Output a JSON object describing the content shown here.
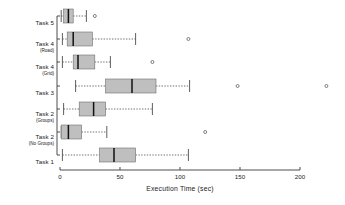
{
  "chart_data": {
    "type": "box",
    "title": "",
    "xlabel": "Execution  Time (sec)",
    "ylabel": "",
    "xlim": [
      -5,
      230
    ],
    "xticks": [
      0,
      50,
      100,
      150,
      200
    ],
    "xticklabels": [
      "0",
      "50",
      "100",
      "150",
      "200"
    ],
    "grid": false,
    "legend": null,
    "orientation": "horizontal",
    "box_fill": "#bfbfbf",
    "box_edge": "#6e6e6e",
    "median_color": "#111111",
    "whisker_style": "dotted",
    "categories": [
      {
        "label": "Task 5",
        "sublabel": ""
      },
      {
        "label": "Task 4",
        "sublabel": "(Road)"
      },
      {
        "label": "Task 4",
        "sublabel": "(Grid)"
      },
      {
        "label": "Task 3",
        "sublabel": ""
      },
      {
        "label": "Task 2",
        "sublabel": "(Groups)"
      },
      {
        "label": "Task 2",
        "sublabel": "(No Groups)"
      },
      {
        "label": "Task 1",
        "sublabel": ""
      }
    ],
    "boxes": [
      {
        "category": "Task 5",
        "min": 1,
        "q1": 3,
        "median": 7,
        "q3": 11,
        "max": 22,
        "outliers": [
          29
        ]
      },
      {
        "category": "Task 4 (Road)",
        "min": 2,
        "q1": 6,
        "median": 11,
        "q3": 27,
        "max": 63,
        "outliers": [
          107
        ]
      },
      {
        "category": "Task 4 (Grid)",
        "min": 2,
        "q1": 11,
        "median": 15,
        "q3": 29,
        "max": 42,
        "outliers": [
          77
        ]
      },
      {
        "category": "Task 3",
        "min": 13,
        "q1": 38,
        "median": 60,
        "q3": 80,
        "max": 108,
        "outliers": [
          148,
          222
        ]
      },
      {
        "category": "Task 2 (Groups)",
        "min": 3,
        "q1": 16,
        "median": 28,
        "q3": 38,
        "max": 77,
        "outliers": []
      },
      {
        "category": "Task 2 (No Groups)",
        "min": 1,
        "q1": 1,
        "median": 7,
        "q3": 18,
        "max": 39,
        "outliers": [
          121
        ]
      },
      {
        "category": "Task 1",
        "min": 2,
        "q1": 33,
        "median": 45,
        "q3": 63,
        "max": 107,
        "outliers": []
      }
    ]
  }
}
